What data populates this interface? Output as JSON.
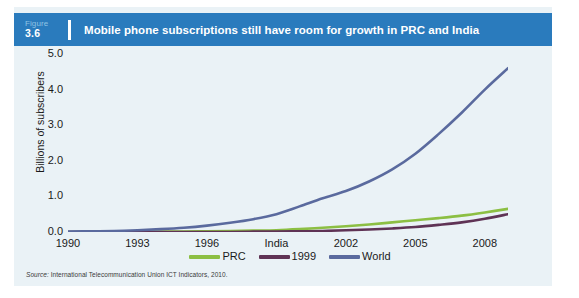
{
  "figure": {
    "label_word": "Figure",
    "number": "3.6",
    "title": "Mobile phone subscriptions still have room for growth in PRC and India"
  },
  "source": {
    "prefix": "Source:",
    "text": "International Telecommunication Union ICT Indicators, 2010."
  },
  "colors": {
    "header_blue": "#2a7bbd",
    "panel_background": "#eaf2f6",
    "prc_green": "#8cbf43",
    "india_purple": "#5f3355",
    "world_blue": "#5a6a9e"
  },
  "chart_data": {
    "type": "line",
    "title": "Mobile phone subscriptions still have room for growth in PRC and India",
    "xlabel": "",
    "ylabel": "Billions of subscribers",
    "xlim": [
      1990,
      2009
    ],
    "ylim": [
      0.0,
      5.0
    ],
    "grid": false,
    "legend_position": "bottom",
    "x_tick_labels": [
      "1990",
      "1993",
      "1996",
      "India",
      "2002",
      "2005",
      "2008"
    ],
    "x_tick_values": [
      1990,
      1993,
      1996,
      1999,
      2002,
      2005,
      2008
    ],
    "y_tick_labels": [
      "0.0",
      "1.0",
      "2.0",
      "3.0",
      "4.0",
      "5.0"
    ],
    "y_tick_values": [
      0.0,
      1.0,
      2.0,
      3.0,
      4.0,
      5.0
    ],
    "x": [
      1990,
      1991,
      1992,
      1993,
      1994,
      1995,
      1996,
      1997,
      1998,
      1999,
      2000,
      2001,
      2002,
      2003,
      2004,
      2005,
      2006,
      2007,
      2008,
      2009
    ],
    "series": [
      {
        "name": "PRC",
        "color": "#8cbf43",
        "values": [
          0.0,
          0.0,
          0.0,
          0.0,
          0.01,
          0.01,
          0.02,
          0.03,
          0.04,
          0.05,
          0.08,
          0.12,
          0.16,
          0.21,
          0.27,
          0.33,
          0.39,
          0.46,
          0.55,
          0.65
        ]
      },
      {
        "name": "1999",
        "color": "#5f3355",
        "values": [
          0.0,
          0.0,
          0.0,
          0.0,
          0.0,
          0.0,
          0.0,
          0.0,
          0.01,
          0.01,
          0.02,
          0.03,
          0.05,
          0.07,
          0.1,
          0.14,
          0.2,
          0.27,
          0.37,
          0.5
        ]
      },
      {
        "name": "World",
        "color": "#5a6a9e",
        "values": [
          0.01,
          0.02,
          0.03,
          0.05,
          0.08,
          0.12,
          0.18,
          0.26,
          0.36,
          0.5,
          0.72,
          0.95,
          1.15,
          1.42,
          1.76,
          2.2,
          2.75,
          3.35,
          4.0,
          4.6
        ]
      }
    ]
  }
}
